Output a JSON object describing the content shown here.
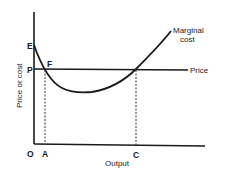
{
  "diagram": {
    "axes": {
      "x_label": "Output",
      "y_label": "Price or cost",
      "origin_label": "O"
    },
    "points": {
      "E": "E",
      "P": "P",
      "F": "F",
      "A": "A",
      "C": "C"
    },
    "curves": {
      "marginal_cost_label_line1": "Marginal",
      "marginal_cost_label_line2": "cost",
      "price_label": "Price"
    }
  }
}
